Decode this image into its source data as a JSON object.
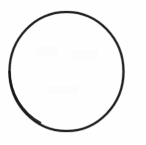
{
  "figure": {
    "title": "",
    "canvas": {
      "width": 146,
      "height": 145,
      "background_color": "#fefefe"
    },
    "shapes": [
      {
        "name": "circle-outline",
        "type": "ellipse",
        "center_x": 66.5,
        "center_y": 71.5,
        "radius_x": 57.0,
        "radius_y": 59.5,
        "stroke_color": "#232323",
        "stroke_width": 2,
        "fill": "none",
        "label": ""
      }
    ],
    "labels": [],
    "annotations": []
  }
}
